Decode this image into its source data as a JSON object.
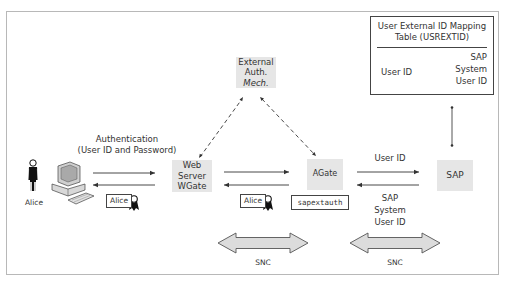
{
  "diagram": {
    "mapping_table": {
      "title_line1": "User External ID Mapping",
      "title_line2": "Table (USREXTID)",
      "left_label": "User ID",
      "right_line1": "SAP",
      "right_line2": "System",
      "right_line3": "User ID"
    },
    "nodes": {
      "external_auth": {
        "line1": "External",
        "line2": "Auth.",
        "line3": "Mech."
      },
      "web_server": {
        "line1": "Web",
        "line2": "Server",
        "line3": "WGate"
      },
      "agate": {
        "label": "AGate"
      },
      "sap": {
        "label": "SAP"
      },
      "user": {
        "label": "Alice"
      }
    },
    "edge_labels": {
      "authentication_line1": "Authentication",
      "authentication_line2": "(User ID and Password)",
      "user_id": "User ID",
      "sap_user_line1": "SAP",
      "sap_user_line2": "System",
      "sap_user_line3": "User ID"
    },
    "certificates": [
      {
        "label": "Alice"
      },
      {
        "label": "Alice"
      }
    ],
    "sapextauth": {
      "label": "sapextauth"
    },
    "snc": [
      {
        "label": "SNC"
      },
      {
        "label": "SNC"
      }
    ],
    "colors": {
      "node_fill": "#e6e6e6",
      "arrow_fill": "#d9d9d9",
      "line": "#333333",
      "frame": "#b8b8b8"
    }
  }
}
